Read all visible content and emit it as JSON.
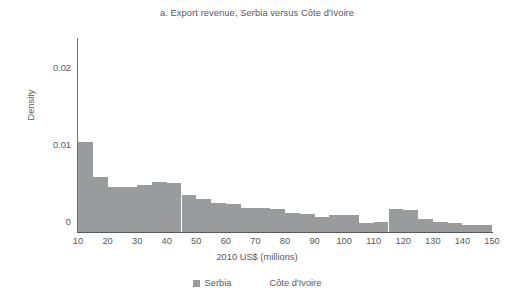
{
  "chart_data": {
    "type": "bar",
    "title": "a. Export revenue, Serbia versus Côte d'Ivoire",
    "xlabel": "2010 US$ (millions)",
    "ylabel": "Density",
    "xlim": [
      10,
      150
    ],
    "ylim": [
      0,
      0.05
    ],
    "grid": false,
    "legend_position": "bottom",
    "bin_width": 5,
    "xticks": [
      10,
      20,
      30,
      40,
      50,
      60,
      70,
      80,
      90,
      100,
      110,
      120,
      130,
      140,
      150
    ],
    "xtick_labels": [
      "10",
      "20",
      "30",
      "40",
      "50",
      "60",
      "70",
      "80",
      "90",
      "100",
      "110",
      "120",
      "130",
      "140",
      "150"
    ],
    "yticks": [
      0,
      0.01,
      0.02,
      0.03,
      0.04,
      0.05
    ],
    "ytick_labels": [
      "0",
      "0.01",
      "0.02",
      "0.03",
      "0.04",
      "0.05"
    ],
    "bin_starts": [
      10,
      15,
      20,
      25,
      30,
      35,
      40,
      45,
      50,
      55,
      60,
      65,
      70,
      75,
      80,
      85,
      90,
      95,
      100,
      105,
      110,
      115,
      120,
      125,
      130,
      135,
      140,
      145
    ],
    "series": [
      {
        "name": "Serbia",
        "color": "#9a9b9c",
        "values": [
          0.0234,
          0.0143,
          0.0117,
          0.0117,
          0.0122,
          0.013,
          0.0127,
          0.0096,
          0.0086,
          0.0075,
          0.0073,
          0.0062,
          0.0062,
          0.006,
          0.0049,
          0.0047,
          0.0039,
          0.0044,
          0.0044,
          0.0023,
          0.0026,
          0.006,
          0.0057,
          0.0034,
          0.0026,
          0.0023,
          0.0018,
          0.0018
        ]
      },
      {
        "name": "Côte d'Ivoire",
        "color": "#fdfdfd",
        "values": [
          0,
          0,
          0,
          0,
          0,
          0,
          0,
          0,
          0,
          0,
          0,
          0,
          0,
          0,
          0,
          0,
          0,
          0,
          0,
          0,
          0,
          0,
          0,
          0,
          0,
          0,
          0,
          0
        ]
      }
    ]
  },
  "legend": {
    "entries": [
      {
        "label": "Serbia",
        "color": "#9a9b9c"
      },
      {
        "label": "Côte d'Ivoire",
        "color": "#fdfdfd"
      }
    ]
  }
}
